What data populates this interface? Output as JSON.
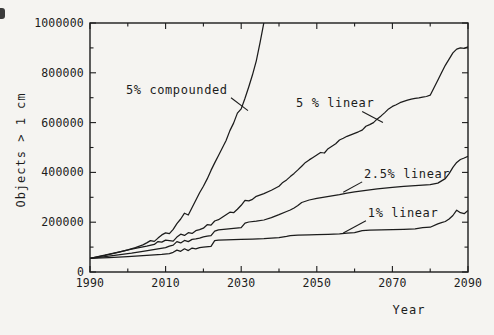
{
  "figure": {
    "ink_color": "#1c1c1c",
    "paper_color": "#f5f4f1",
    "caption_fragment": "Figure 11."
  },
  "chart_data": {
    "type": "line",
    "title": "",
    "xlabel": "Year",
    "ylabel": "Objects > 1 cm",
    "xlim": [
      1990,
      2090
    ],
    "ylim": [
      0,
      1000000
    ],
    "grid": false,
    "legend": "inline annotations with leader lines",
    "x_major_ticks": {
      "values": [
        1990,
        2010,
        2030,
        2050,
        2070,
        2090
      ],
      "labels": [
        "1990",
        "2010",
        "2030",
        "2050",
        "2070",
        "2090"
      ]
    },
    "x_minor_ticks": [
      2000,
      2020,
      2040,
      2060,
      2080
    ],
    "y_major_ticks": {
      "values": [
        0,
        200000,
        400000,
        600000,
        800000,
        1000000
      ],
      "labels": [
        "0",
        "200000",
        "400000",
        "600000",
        "800000",
        "1000000"
      ]
    },
    "y_minor_ticks": [
      100000,
      300000,
      500000,
      700000,
      900000
    ],
    "series": [
      {
        "name": "5% compounded",
        "points": [
          [
            1990,
            55000
          ],
          [
            1992,
            61000
          ],
          [
            1994,
            67000
          ],
          [
            1996,
            74000
          ],
          [
            1998,
            81000
          ],
          [
            2000,
            89000
          ],
          [
            2002,
            98000
          ],
          [
            2004,
            109000
          ],
          [
            2005,
            117000
          ],
          [
            2006,
            126000
          ],
          [
            2007,
            123000
          ],
          [
            2008,
            136000
          ],
          [
            2009,
            149000
          ],
          [
            2010,
            157000
          ],
          [
            2011,
            154000
          ],
          [
            2012,
            171000
          ],
          [
            2013,
            194000
          ],
          [
            2014,
            213000
          ],
          [
            2015,
            236000
          ],
          [
            2016,
            229000
          ],
          [
            2017,
            259000
          ],
          [
            2018,
            288000
          ],
          [
            2019,
            318000
          ],
          [
            2020,
            344000
          ],
          [
            2021,
            374000
          ],
          [
            2022,
            408000
          ],
          [
            2023,
            438000
          ],
          [
            2024,
            468000
          ],
          [
            2025,
            498000
          ],
          [
            2026,
            528000
          ],
          [
            2027,
            568000
          ],
          [
            2028,
            598000
          ],
          [
            2029,
            638000
          ],
          [
            2030,
            655000
          ],
          [
            2031,
            698000
          ],
          [
            2032,
            744000
          ],
          [
            2033,
            792000
          ],
          [
            2034,
            848000
          ],
          [
            2035,
            922000
          ],
          [
            2036,
            1002000
          ],
          [
            2037,
            1080000
          ]
        ]
      },
      {
        "name": "5 % linear",
        "points": [
          [
            1990,
            55000
          ],
          [
            1993,
            65000
          ],
          [
            1996,
            75000
          ],
          [
            1999,
            85000
          ],
          [
            2001,
            92000
          ],
          [
            2003,
            98000
          ],
          [
            2005,
            104000
          ],
          [
            2007,
            111000
          ],
          [
            2008,
            122000
          ],
          [
            2009,
            120000
          ],
          [
            2010,
            128000
          ],
          [
            2011,
            126000
          ],
          [
            2012,
            124000
          ],
          [
            2013,
            140000
          ],
          [
            2014,
            152000
          ],
          [
            2015,
            147000
          ],
          [
            2016,
            158000
          ],
          [
            2017,
            155000
          ],
          [
            2018,
            166000
          ],
          [
            2019,
            170000
          ],
          [
            2020,
            176000
          ],
          [
            2021,
            190000
          ],
          [
            2022,
            188000
          ],
          [
            2023,
            205000
          ],
          [
            2024,
            210000
          ],
          [
            2025,
            220000
          ],
          [
            2026,
            230000
          ],
          [
            2027,
            240000
          ],
          [
            2028,
            238000
          ],
          [
            2029,
            252000
          ],
          [
            2030,
            268000
          ],
          [
            2031,
            288000
          ],
          [
            2032,
            286000
          ],
          [
            2033,
            292000
          ],
          [
            2034,
            304000
          ],
          [
            2036,
            315000
          ],
          [
            2038,
            328000
          ],
          [
            2040,
            344000
          ],
          [
            2041,
            360000
          ],
          [
            2042,
            370000
          ],
          [
            2043,
            383000
          ],
          [
            2044,
            396000
          ],
          [
            2045,
            410000
          ],
          [
            2046,
            425000
          ],
          [
            2047,
            440000
          ],
          [
            2048,
            450000
          ],
          [
            2049,
            460000
          ],
          [
            2050,
            470000
          ],
          [
            2051,
            480000
          ],
          [
            2052,
            478000
          ],
          [
            2053,
            495000
          ],
          [
            2054,
            505000
          ],
          [
            2055,
            515000
          ],
          [
            2056,
            530000
          ],
          [
            2057,
            537000
          ],
          [
            2058,
            545000
          ],
          [
            2059,
            551000
          ],
          [
            2060,
            557000
          ],
          [
            2061,
            563000
          ],
          [
            2062,
            570000
          ],
          [
            2063,
            585000
          ],
          [
            2064,
            592000
          ],
          [
            2065,
            600000
          ],
          [
            2066,
            615000
          ],
          [
            2067,
            627000
          ],
          [
            2068,
            640000
          ],
          [
            2069,
            655000
          ],
          [
            2070,
            665000
          ],
          [
            2071,
            672000
          ],
          [
            2072,
            680000
          ],
          [
            2073,
            685000
          ],
          [
            2074,
            690000
          ],
          [
            2075,
            694000
          ],
          [
            2076,
            697000
          ],
          [
            2077,
            699000
          ],
          [
            2078,
            702000
          ],
          [
            2079,
            705000
          ],
          [
            2080,
            710000
          ],
          [
            2081,
            740000
          ],
          [
            2082,
            770000
          ],
          [
            2083,
            800000
          ],
          [
            2084,
            830000
          ],
          [
            2085,
            855000
          ],
          [
            2086,
            880000
          ],
          [
            2087,
            895000
          ],
          [
            2088,
            900000
          ],
          [
            2089,
            898000
          ],
          [
            2090,
            905000
          ]
        ]
      },
      {
        "name": "2.5% linear",
        "points": [
          [
            1990,
            55000
          ],
          [
            1994,
            62000
          ],
          [
            1998,
            70000
          ],
          [
            2001,
            76000
          ],
          [
            2004,
            83000
          ],
          [
            2006,
            88000
          ],
          [
            2008,
            93000
          ],
          [
            2010,
            98000
          ],
          [
            2011,
            104000
          ],
          [
            2012,
            108000
          ],
          [
            2013,
            122000
          ],
          [
            2014,
            117000
          ],
          [
            2015,
            127000
          ],
          [
            2016,
            122000
          ],
          [
            2017,
            131000
          ],
          [
            2018,
            133000
          ],
          [
            2019,
            136000
          ],
          [
            2020,
            141000
          ],
          [
            2021,
            144000
          ],
          [
            2022,
            146000
          ],
          [
            2023,
            164000
          ],
          [
            2024,
            169000
          ],
          [
            2026,
            172000
          ],
          [
            2028,
            175000
          ],
          [
            2030,
            178000
          ],
          [
            2031,
            196000
          ],
          [
            2032,
            201000
          ],
          [
            2034,
            204000
          ],
          [
            2036,
            209000
          ],
          [
            2038,
            218000
          ],
          [
            2040,
            230000
          ],
          [
            2042,
            243000
          ],
          [
            2043,
            249000
          ],
          [
            2044,
            257000
          ],
          [
            2045,
            267000
          ],
          [
            2046,
            279000
          ],
          [
            2048,
            289000
          ],
          [
            2050,
            296000
          ],
          [
            2052,
            301000
          ],
          [
            2054,
            306000
          ],
          [
            2056,
            311000
          ],
          [
            2058,
            317000
          ],
          [
            2060,
            322000
          ],
          [
            2063,
            328000
          ],
          [
            2066,
            334000
          ],
          [
            2070,
            340000
          ],
          [
            2073,
            344000
          ],
          [
            2076,
            347000
          ],
          [
            2080,
            351000
          ],
          [
            2082,
            357000
          ],
          [
            2084,
            375000
          ],
          [
            2085,
            395000
          ],
          [
            2086,
            420000
          ],
          [
            2087,
            440000
          ],
          [
            2088,
            452000
          ],
          [
            2089,
            458000
          ],
          [
            2090,
            465000
          ]
        ]
      },
      {
        "name": "1% linear",
        "points": [
          [
            1990,
            55000
          ],
          [
            1995,
            58000
          ],
          [
            2000,
            62000
          ],
          [
            2004,
            66000
          ],
          [
            2007,
            69000
          ],
          [
            2009,
            71000
          ],
          [
            2011,
            74000
          ],
          [
            2012,
            79000
          ],
          [
            2013,
            88000
          ],
          [
            2014,
            83000
          ],
          [
            2015,
            93000
          ],
          [
            2016,
            86000
          ],
          [
            2017,
            96000
          ],
          [
            2018,
            93000
          ],
          [
            2019,
            98000
          ],
          [
            2020,
            100000
          ],
          [
            2022,
            103000
          ],
          [
            2023,
            126000
          ],
          [
            2024,
            128000
          ],
          [
            2026,
            129000
          ],
          [
            2028,
            130000
          ],
          [
            2030,
            131000
          ],
          [
            2033,
            132000
          ],
          [
            2036,
            134000
          ],
          [
            2040,
            138000
          ],
          [
            2042,
            143000
          ],
          [
            2043,
            146000
          ],
          [
            2045,
            148000
          ],
          [
            2048,
            149000
          ],
          [
            2050,
            150000
          ],
          [
            2053,
            151000
          ],
          [
            2056,
            153000
          ],
          [
            2058,
            156000
          ],
          [
            2060,
            158000
          ],
          [
            2062,
            166000
          ],
          [
            2064,
            168000
          ],
          [
            2067,
            169000
          ],
          [
            2070,
            170000
          ],
          [
            2073,
            171000
          ],
          [
            2076,
            173000
          ],
          [
            2078,
            178000
          ],
          [
            2080,
            180000
          ],
          [
            2082,
            193000
          ],
          [
            2083,
            198000
          ],
          [
            2084,
            203000
          ],
          [
            2085,
            213000
          ],
          [
            2086,
            227000
          ],
          [
            2087,
            248000
          ],
          [
            2088,
            238000
          ],
          [
            2089,
            234000
          ],
          [
            2090,
            247000
          ]
        ]
      }
    ],
    "annotations": [
      {
        "text": "5% compounded",
        "anchor": [
          1999.5,
          725000
        ],
        "leader": [
          [
            2027.3,
            700000
          ],
          [
            2031.8,
            648000
          ]
        ]
      },
      {
        "text": "5 % linear",
        "anchor": [
          2044.5,
          675000
        ],
        "leader": [
          [
            2062.0,
            645000
          ],
          [
            2067.5,
            600000
          ]
        ]
      },
      {
        "text": "2.5% linear",
        "anchor": [
          2062.5,
          390000
        ],
        "leader": [
          [
            2062.0,
            362000
          ],
          [
            2057.0,
            320000
          ]
        ]
      },
      {
        "text": "1% linear",
        "anchor": [
          2063.5,
          233000
        ],
        "leader": [
          [
            2063.0,
            206000
          ],
          [
            2057.0,
            157000
          ]
        ]
      }
    ]
  }
}
